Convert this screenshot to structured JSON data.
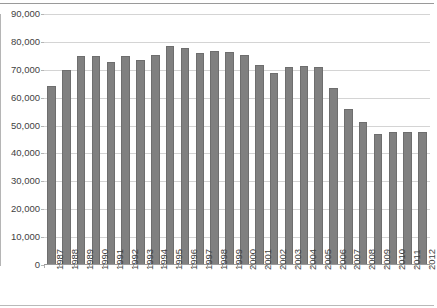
{
  "chart_data": {
    "type": "bar",
    "title": "",
    "subtitle": "",
    "xlabel": "",
    "ylabel": "",
    "ylim": [
      0,
      90000
    ],
    "ytick_step": 10000,
    "ytick_labels": [
      "0",
      "10,000",
      "20,000",
      "30,000",
      "40,000",
      "50,000",
      "60,000",
      "70,000",
      "80,000",
      "90,000"
    ],
    "ytick_values": [
      0,
      10000,
      20000,
      30000,
      40000,
      50000,
      60000,
      70000,
      80000,
      90000
    ],
    "grid": true,
    "legend": false,
    "bar_color": "#808080",
    "bar_edge_color": "#6e6e6e",
    "gridline_color": "#d4d4d4",
    "axis_color": "#9a9a9a",
    "categories": [
      "1987",
      "1988",
      "1989",
      "1990",
      "1991",
      "1992",
      "1993",
      "1994",
      "1995",
      "1996",
      "1997",
      "1998",
      "1999",
      "2000",
      "2001",
      "2002",
      "2003",
      "2004",
      "2005",
      "2006",
      "2007",
      "2008",
      "2009",
      "2010",
      "2011",
      "2012"
    ],
    "values": [
      64000,
      69500,
      74500,
      74500,
      72500,
      74500,
      73000,
      75000,
      78000,
      77500,
      75500,
      76500,
      76000,
      75000,
      71500,
      68500,
      70500,
      71000,
      70500,
      63000,
      55500,
      51000,
      46500,
      47500,
      47500,
      47500
    ]
  },
  "axis": {
    "x_rotation_deg": -90
  }
}
